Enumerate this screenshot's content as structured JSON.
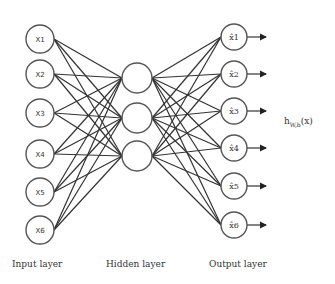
{
  "diagram": {
    "type": "feedforward-neural-network",
    "layers": {
      "input": {
        "label": "Input layer",
        "nodes": [
          "X1",
          "X2",
          "X3",
          "X4",
          "X5",
          "X6"
        ]
      },
      "hidden": {
        "label": "Hidden layer",
        "nodes": [
          "",
          "",
          ""
        ]
      },
      "output": {
        "label": "Output layer",
        "nodes": [
          "x̂1",
          "x̂2",
          "x̂3",
          "x̂4",
          "x̂5",
          "x̂6"
        ]
      }
    },
    "formula": {
      "base": "h",
      "subscript": "W,b",
      "arg": "(x)"
    },
    "colors": {
      "stroke": "#333333",
      "node_stroke": "#555555",
      "background": "#ffffff"
    }
  }
}
